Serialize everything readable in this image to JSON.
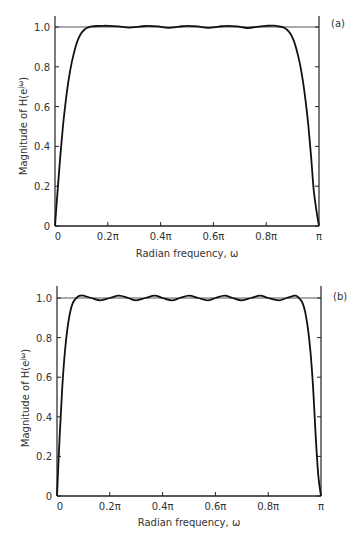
{
  "chart_data": [
    {
      "type": "line",
      "panel_label": "(a)",
      "title": "",
      "xlabel": "Radian frequency, ω",
      "ylabel": "Magnitude of H(e^jω)",
      "xlim": [
        0,
        1
      ],
      "x_unit": "π",
      "ylim": [
        0,
        1.05
      ],
      "x_ticks": [
        "0",
        "0.2π",
        "0.4π",
        "0.6π",
        "0.8π",
        "π"
      ],
      "y_ticks": [
        "0",
        "0.2",
        "0.4",
        "0.6",
        "0.8",
        "1.0"
      ],
      "grid": false,
      "reference_line": {
        "y": 1.0
      },
      "series": [
        {
          "name": "|H(e^jω)|",
          "x": [
            0,
            0.01,
            0.02,
            0.03,
            0.04,
            0.05,
            0.06,
            0.07,
            0.08,
            0.09,
            0.1,
            0.11,
            0.12,
            0.13,
            0.14,
            0.16,
            0.18,
            0.2,
            0.24,
            0.28,
            0.32,
            0.35,
            0.39,
            0.43,
            0.47,
            0.5,
            0.54,
            0.58,
            0.62,
            0.65,
            0.69,
            0.73,
            0.77,
            0.8,
            0.83,
            0.86,
            0.87,
            0.88,
            0.89,
            0.9,
            0.91,
            0.92,
            0.93,
            0.94,
            0.95,
            0.96,
            0.97,
            0.98,
            0.99,
            1.0
          ],
          "y": [
            0,
            0.18,
            0.35,
            0.5,
            0.62,
            0.72,
            0.8,
            0.86,
            0.91,
            0.945,
            0.97,
            0.985,
            0.995,
            1.0,
            1.003,
            1.005,
            1.006,
            1.006,
            1.003,
            0.997,
            1.002,
            1.006,
            1.003,
            0.996,
            1.002,
            1.006,
            1.003,
            0.996,
            1.002,
            1.006,
            1.003,
            0.995,
            1.002,
            1.006,
            1.007,
            1.0,
            0.995,
            0.985,
            0.97,
            0.945,
            0.91,
            0.86,
            0.8,
            0.72,
            0.62,
            0.5,
            0.35,
            0.18,
            0.08,
            0
          ]
        }
      ]
    },
    {
      "type": "line",
      "panel_label": "(b)",
      "title": "",
      "xlabel": "Radian frequency, ω",
      "ylabel": "Magnitude of H(e^jω)",
      "xlim": [
        0,
        1
      ],
      "x_unit": "π",
      "ylim": [
        0,
        1.05
      ],
      "x_ticks": [
        "0",
        "0.2π",
        "0.4π",
        "0.6π",
        "0.8π",
        "π"
      ],
      "y_ticks": [
        "0",
        "0.2",
        "0.4",
        "0.6",
        "0.8",
        "1.0"
      ],
      "grid": false,
      "reference_line": {
        "y": 1.0
      },
      "series": [
        {
          "name": "|H(e^jω)|",
          "x": [
            0,
            0.01,
            0.02,
            0.03,
            0.04,
            0.05,
            0.06,
            0.07,
            0.08,
            0.09,
            0.1,
            0.13,
            0.165,
            0.2,
            0.235,
            0.27,
            0.3,
            0.335,
            0.37,
            0.4,
            0.435,
            0.465,
            0.5,
            0.535,
            0.57,
            0.6,
            0.635,
            0.665,
            0.7,
            0.735,
            0.77,
            0.8,
            0.84,
            0.87,
            0.9,
            0.91,
            0.92,
            0.93,
            0.94,
            0.95,
            0.96,
            0.97,
            0.98,
            0.99,
            1.0
          ],
          "y": [
            0,
            0.3,
            0.55,
            0.73,
            0.85,
            0.93,
            0.975,
            0.995,
            1.008,
            1.012,
            1.012,
            1.0,
            0.988,
            1.0,
            1.012,
            1.0,
            0.988,
            1.0,
            1.012,
            1.0,
            0.988,
            1.0,
            1.012,
            1.0,
            0.988,
            1.0,
            1.012,
            1.0,
            0.988,
            1.0,
            1.012,
            1.0,
            0.988,
            1.0,
            1.012,
            1.008,
            0.995,
            0.975,
            0.93,
            0.85,
            0.73,
            0.55,
            0.3,
            0.1,
            0
          ]
        }
      ]
    }
  ],
  "panels": [
    {
      "tag": "(a)",
      "xlabel": "Radian frequency, ω",
      "ylabel_main": "Magnitude of H(e",
      "ylabel_sup": "jω",
      "ylabel_end": ")",
      "x_ticks": [
        "0",
        "0.2π",
        "0.4π",
        "0.6π",
        "0.8π",
        "π"
      ],
      "y_ticks": [
        "0",
        "0.2",
        "0.4",
        "0.6",
        "0.8",
        "1.0"
      ]
    },
    {
      "tag": "(b)",
      "xlabel": "Radian frequency, ω",
      "ylabel_main": "Magnitude of H(e",
      "ylabel_sup": "jω",
      "ylabel_end": ")",
      "x_ticks": [
        "0",
        "0.2π",
        "0.4π",
        "0.6π",
        "0.8π",
        "π"
      ],
      "y_ticks": [
        "0",
        "0.2",
        "0.4",
        "0.6",
        "0.8",
        "1.0"
      ]
    }
  ],
  "colors": {
    "curve": "#111111",
    "axis": "#222222",
    "reference": "#444444",
    "text": "#333333"
  }
}
